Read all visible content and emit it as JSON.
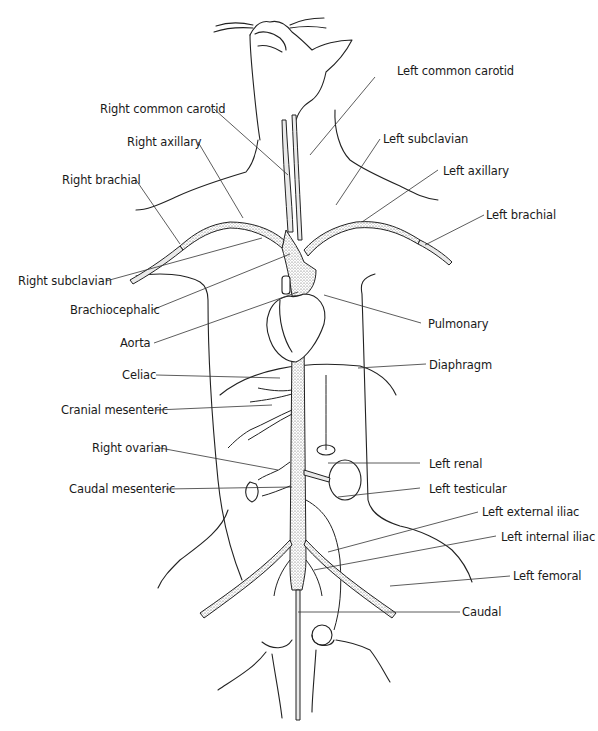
{
  "figure": {
    "labels_left": [
      {
        "id": "right-common-carotid",
        "text": "Right common carotid"
      },
      {
        "id": "right-axillary",
        "text": "Right axillary"
      },
      {
        "id": "right-brachial",
        "text": "Right brachial"
      },
      {
        "id": "right-subclavian",
        "text": "Right subclavian"
      },
      {
        "id": "brachiocephalic",
        "text": "Brachiocephalic"
      },
      {
        "id": "aorta",
        "text": "Aorta"
      },
      {
        "id": "celiac",
        "text": "Celiac"
      },
      {
        "id": "cranial-mesenteric",
        "text": "Cranial mesenteric"
      },
      {
        "id": "right-ovarian",
        "text": "Right ovarian"
      },
      {
        "id": "caudal-mesenteric",
        "text": "Caudal mesenteric"
      }
    ],
    "labels_right": [
      {
        "id": "left-common-carotid",
        "text": "Left common carotid"
      },
      {
        "id": "left-subclavian",
        "text": "Left subclavian"
      },
      {
        "id": "left-axillary",
        "text": "Left axillary"
      },
      {
        "id": "left-brachial",
        "text": "Left brachial"
      },
      {
        "id": "pulmonary",
        "text": "Pulmonary"
      },
      {
        "id": "diaphragm",
        "text": "Diaphragm"
      },
      {
        "id": "left-renal",
        "text": "Left renal"
      },
      {
        "id": "left-testicular",
        "text": "Left testicular"
      },
      {
        "id": "left-external-iliac",
        "text": "Left external iliac"
      },
      {
        "id": "left-internal-iliac",
        "text": "Left internal iliac"
      },
      {
        "id": "left-femoral",
        "text": "Left femoral"
      },
      {
        "id": "caudal",
        "text": "Caudal"
      }
    ],
    "colors": {
      "line": "#222222",
      "text": "#1a1a1a",
      "background": "#ffffff",
      "stipple": "#555555"
    }
  }
}
